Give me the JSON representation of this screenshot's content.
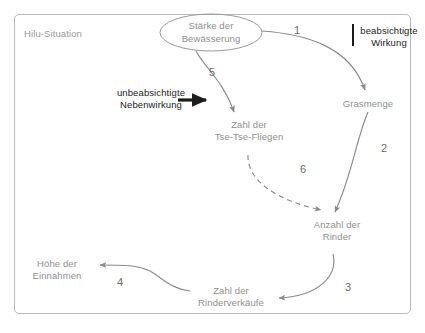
{
  "diagram": {
    "title": "Hilu-Situation",
    "type": "causal-loop-diagram",
    "language": "de",
    "colors": {
      "frame_border": "#b9b9b9",
      "node_text": "#8f8f8f",
      "arrow": "#8a8a8a",
      "legend_text": "#1c1c1c",
      "number_text": "#6d6d6d",
      "background": "#ffffff"
    },
    "nodes": [
      {
        "id": "bewaesserung",
        "line1": "Stärke der",
        "line2": "Bewässerung",
        "shape": "ellipse"
      },
      {
        "id": "grasmenge",
        "line1": "Grasmenge",
        "line2": "",
        "shape": "text"
      },
      {
        "id": "tsetse",
        "line1": "Zahl der",
        "line2": "Tse-Tse-Fliegen",
        "shape": "text"
      },
      {
        "id": "rinder",
        "line1": "Anzahl der",
        "line2": "Rinder",
        "shape": "text"
      },
      {
        "id": "rinderverkaeufe",
        "line1": "Zahl der",
        "line2": "Rinderverkäufe",
        "shape": "text"
      },
      {
        "id": "einnahmen",
        "line1": "Höhe der",
        "line2": "Einnahmen",
        "shape": "text"
      }
    ],
    "edges": [
      {
        "number": "1",
        "from": "bewaesserung",
        "to": "grasmenge",
        "style": "solid"
      },
      {
        "number": "2",
        "from": "grasmenge",
        "to": "rinder",
        "style": "solid"
      },
      {
        "number": "3",
        "from": "rinder",
        "to": "rinderverkaeufe",
        "style": "solid"
      },
      {
        "number": "4",
        "from": "rinderverkaeufe",
        "to": "einnahmen",
        "style": "solid"
      },
      {
        "number": "5",
        "from": "bewaesserung",
        "to": "tsetse",
        "style": "solid"
      },
      {
        "number": "6",
        "from": "tsetse",
        "to": "rinder",
        "style": "dashed"
      }
    ],
    "legend": [
      {
        "id": "beabsichtigte",
        "line1": "beabsichtigte",
        "line2": "Wirkung",
        "marker": "vertical-bar"
      },
      {
        "id": "unbeabsichtigte",
        "line1": "unbeabsichtigte",
        "line2": "Nebenwirkung",
        "marker": "thick-arrow"
      }
    ]
  }
}
